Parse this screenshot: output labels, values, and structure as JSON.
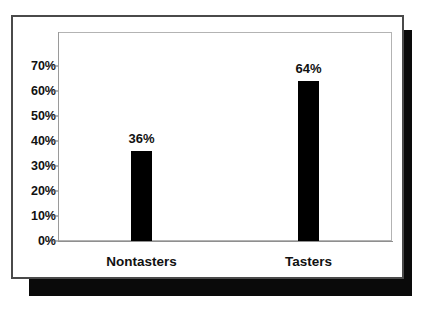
{
  "chart_data": {
    "type": "bar",
    "title": "",
    "subtitle": "",
    "xlabel": "",
    "ylabel": "",
    "categories": [
      "Nontasters",
      "Tasters"
    ],
    "values": [
      36,
      64
    ],
    "value_labels": [
      "36%",
      "64%"
    ],
    "ylim": [
      0,
      70
    ],
    "ytick_values": [
      70,
      60,
      50,
      40,
      30,
      20,
      10,
      0
    ],
    "ytick_labels": [
      "70%",
      "60%",
      "50%",
      "40%",
      "30%",
      "20%",
      "10%",
      "0%"
    ],
    "grid": false,
    "legend": null,
    "legend_position": "none",
    "series": [
      {
        "name": "",
        "values": [
          36,
          64
        ],
        "color": "#000000"
      }
    ],
    "annotations": []
  },
  "figure": {
    "bar_color": "#000000",
    "card_background": "#ffffff",
    "card_border_color": "#4a4a4a",
    "shadow_color": "#0a0a0a",
    "plot_border_color": "#b3b3b3",
    "axis_color": "#8f8f8f",
    "text_color": "#111111"
  }
}
